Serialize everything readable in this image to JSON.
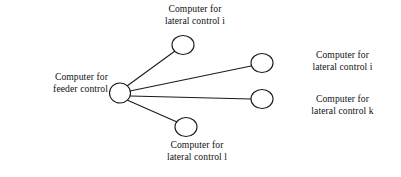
{
  "diagram": {
    "background_color": "#ffffff",
    "line_color": "#1a1a1a",
    "node_fill_color": "#ffffff",
    "nodes": [
      {
        "id": "feeder",
        "role": "hub",
        "label": "Computer for\nfeeder control",
        "cx": 120,
        "cy": 93,
        "rx": 10.5,
        "ry": 10
      },
      {
        "id": "lateral-i-top",
        "role": "leaf",
        "label": "Computer for\nlateral control i",
        "cx": 183,
        "cy": 45,
        "rx": 11,
        "ry": 9.5
      },
      {
        "id": "lateral-i-right",
        "role": "leaf",
        "label": "Computer for\nlateral control i",
        "cx": 262,
        "cy": 63,
        "rx": 11,
        "ry": 9.5
      },
      {
        "id": "lateral-k-right",
        "role": "leaf",
        "label": "Computer for\nlateral control k",
        "cx": 262,
        "cy": 99,
        "rx": 11,
        "ry": 9.5
      },
      {
        "id": "lateral-l-bottom",
        "role": "leaf",
        "label": "Computer for\nlateral control l",
        "cx": 186,
        "cy": 127,
        "rx": 11,
        "ry": 9.5
      }
    ],
    "links": [
      {
        "from": "feeder",
        "to": "lateral-i-top",
        "x1": 127,
        "y1": 86,
        "x2": 175,
        "y2": 51
      },
      {
        "from": "feeder",
        "to": "lateral-i-right",
        "x1": 130,
        "y1": 91,
        "x2": 251,
        "y2": 66
      },
      {
        "from": "feeder",
        "to": "lateral-k-right",
        "x1": 130.5,
        "y1": 96,
        "x2": 251,
        "y2": 99
      },
      {
        "from": "feeder",
        "to": "lateral-l-bottom",
        "x1": 127,
        "y1": 100,
        "x2": 177,
        "y2": 122
      }
    ],
    "labels": {
      "top": "Computer for\nlateral control i",
      "feeder": "Computer for\nfeeder control",
      "upper_right": "Computer for\nlateral control i",
      "mid_right": "Computer for\nlateral control k",
      "bottom": "Computer for\nlateral control l"
    }
  }
}
